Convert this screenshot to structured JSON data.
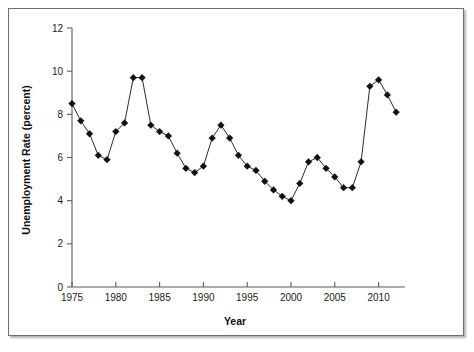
{
  "chart_data": {
    "type": "line",
    "title": "",
    "subtitle": "",
    "xlabel": "Year",
    "ylabel": "Unemployment Rate (percent)",
    "xlim": [
      1974,
      2013
    ],
    "ylim": [
      0,
      12
    ],
    "grid": false,
    "legend": null,
    "legend_position": "none",
    "marker": "diamond",
    "marker_color": "#111111",
    "line_color": "#2b2b2b",
    "xticks": [
      1975,
      1980,
      1985,
      1990,
      1995,
      2000,
      2005,
      2010
    ],
    "xtick_labels": [
      "1975",
      "1980",
      "1985",
      "1990",
      "1995",
      "2000",
      "2005",
      "2010"
    ],
    "yticks": [
      0,
      2,
      4,
      6,
      8,
      10,
      12
    ],
    "ytick_labels": [
      "0",
      "2",
      "4",
      "6",
      "8",
      "10",
      "12"
    ],
    "x": [
      1975,
      1976,
      1977,
      1978,
      1979,
      1980,
      1981,
      1982,
      1983,
      1984,
      1985,
      1986,
      1987,
      1988,
      1989,
      1990,
      1991,
      1992,
      1993,
      1994,
      1995,
      1996,
      1997,
      1998,
      1999,
      2000,
      2001,
      2002,
      2003,
      2004,
      2005,
      2006,
      2007,
      2008,
      2009,
      2010,
      2011,
      2012
    ],
    "values": [
      8.5,
      7.7,
      7.1,
      6.1,
      5.9,
      7.2,
      7.6,
      9.7,
      9.7,
      7.5,
      7.2,
      7.0,
      6.2,
      5.5,
      5.3,
      5.6,
      6.9,
      7.5,
      6.9,
      6.1,
      5.6,
      5.4,
      4.9,
      4.5,
      4.2,
      4.0,
      4.8,
      5.8,
      6.0,
      5.5,
      5.1,
      4.6,
      4.6,
      5.8,
      9.3,
      9.6,
      8.9,
      8.1
    ]
  }
}
